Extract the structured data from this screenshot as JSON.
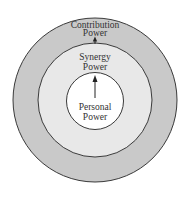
{
  "diagram": {
    "type": "concentric-circles",
    "colors": {
      "background": "#ffffff",
      "outer_fill": "#c9c9c9",
      "middle_fill": "#e8e8e8",
      "inner_fill": "#ffffff",
      "stroke": "#3a3a3a",
      "text": "#333333"
    },
    "rings": [
      {
        "id": "outer",
        "line1": "Contribution",
        "line2": "Power"
      },
      {
        "id": "middle",
        "line1": "Synergy",
        "line2": "Power"
      },
      {
        "id": "inner",
        "line1": "Personal",
        "line2": "Power"
      }
    ],
    "arrows": [
      {
        "from": "inner",
        "to": "middle",
        "direction": "up"
      },
      {
        "from": "middle",
        "to": "outer",
        "direction": "up"
      }
    ]
  }
}
